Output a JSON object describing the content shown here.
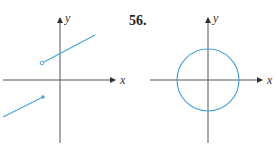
{
  "exercise_number": "56.",
  "graphs": [
    {
      "id": "left",
      "x_label": "x",
      "y_label": "y",
      "description": "piecewise linear with jump: open circle at upper segment start, filled dot at lower segment end"
    },
    {
      "id": "right",
      "x_label": "x",
      "y_label": "y",
      "description": "circle centered at origin"
    }
  ],
  "colors": {
    "axis": "#444444",
    "curve": "#4aa3d9"
  }
}
